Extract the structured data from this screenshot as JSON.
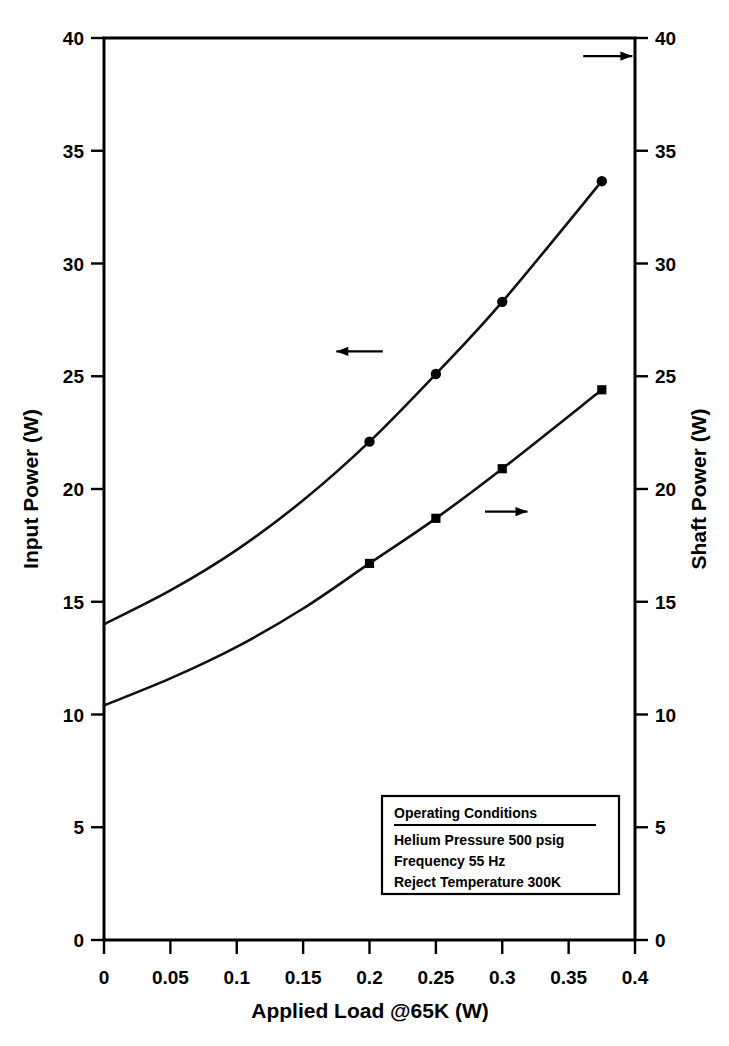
{
  "chart_data": {
    "type": "line",
    "title": "",
    "xlabel": "Applied Load @65K (W)",
    "ylabel": "Input Power (W)",
    "y2label": "Shaft Power (W)",
    "xlim": [
      0,
      0.4
    ],
    "ylim": [
      0,
      40
    ],
    "y2lim": [
      0,
      40
    ],
    "grid": false,
    "legend_position": "inside-box-lower-right",
    "xticks": [
      "0",
      "0.05",
      "0.1",
      "0.15",
      "0.2",
      "0.25",
      "0.3",
      "0.35",
      "0.4"
    ],
    "xtick_values": [
      0,
      0.05,
      0.1,
      0.15,
      0.2,
      0.25,
      0.3,
      0.35,
      0.4
    ],
    "yticks": [
      "0",
      "5",
      "10",
      "15",
      "20",
      "25",
      "30",
      "35",
      "40"
    ],
    "ytick_values": [
      0,
      5,
      10,
      15,
      20,
      25,
      30,
      35,
      40
    ],
    "y2ticks": [
      "0",
      "5",
      "10",
      "15",
      "20",
      "25",
      "30",
      "35",
      "40"
    ],
    "y2tick_values": [
      0,
      5,
      10,
      15,
      20,
      25,
      30,
      35,
      40
    ],
    "series": [
      {
        "name": "Input Power",
        "axis": "left",
        "marker": "circle",
        "x": [
          0,
          0.05,
          0.1,
          0.15,
          0.2,
          0.25,
          0.3,
          0.375
        ],
        "values": [
          14.0,
          15.5,
          17.3,
          19.5,
          22.1,
          25.1,
          28.3,
          33.65
        ],
        "marked_points_x": [
          0.2,
          0.25,
          0.3,
          0.375
        ],
        "marked_points_y": [
          22.1,
          25.1,
          28.3,
          33.65
        ]
      },
      {
        "name": "Shaft Power",
        "axis": "right",
        "marker": "square",
        "x": [
          0,
          0.05,
          0.1,
          0.15,
          0.2,
          0.25,
          0.3,
          0.375
        ],
        "values": [
          10.4,
          11.6,
          13.0,
          14.7,
          16.7,
          18.7,
          20.9,
          24.4
        ],
        "marked_points_x": [
          0.2,
          0.25,
          0.3,
          0.375
        ],
        "marked_points_y": [
          16.7,
          18.7,
          20.9,
          24.4
        ]
      }
    ],
    "annotations": [
      {
        "name": "arrow-left-input-power",
        "direction": "left",
        "x1": 0.21,
        "y1": 26.1,
        "x2": 0.175,
        "y2": 26.1
      },
      {
        "name": "arrow-right-shaft-power",
        "direction": "right",
        "x1": 0.287,
        "y1": 19.0,
        "x2": 0.319,
        "y2": 19.0
      },
      {
        "name": "arrow-right-top-shaft-axis",
        "direction": "right",
        "x1": 0.361,
        "y1": 39.2,
        "x2": 0.398,
        "y2": 39.2
      }
    ]
  },
  "legend": {
    "title": "Operating Conditions",
    "lines": [
      "Helium Pressure 500 psig",
      "Frequency 55 Hz",
      "Reject Temperature 300K"
    ]
  },
  "colors": {
    "ink": "#000000",
    "background": "#ffffff",
    "curve": "#111111"
  }
}
